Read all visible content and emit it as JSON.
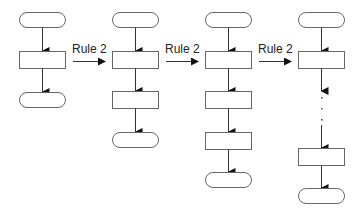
{
  "diagram": {
    "type": "flowchart-rule-application",
    "transition_label": "Rule 2",
    "transitions": [
      {
        "label": "Rule 2",
        "from_column": 1,
        "to_column": 2
      },
      {
        "label": "Rule 2",
        "from_column": 2,
        "to_column": 3
      },
      {
        "label": "Rule 2",
        "from_column": 3,
        "to_column": 4
      }
    ],
    "columns": [
      {
        "index": 1,
        "nodes": [
          "terminal",
          "process",
          "terminal"
        ]
      },
      {
        "index": 2,
        "nodes": [
          "terminal",
          "process",
          "process",
          "terminal"
        ]
      },
      {
        "index": 3,
        "nodes": [
          "terminal",
          "process",
          "process",
          "process",
          "terminal"
        ]
      },
      {
        "index": 4,
        "nodes": [
          "terminal",
          "process",
          "ellipsis",
          "process",
          "terminal"
        ]
      }
    ],
    "ellipsis": "...",
    "colors": {
      "stroke": "#555555",
      "arrow": "#111111",
      "text": "#222222",
      "background": "#ffffff"
    }
  }
}
